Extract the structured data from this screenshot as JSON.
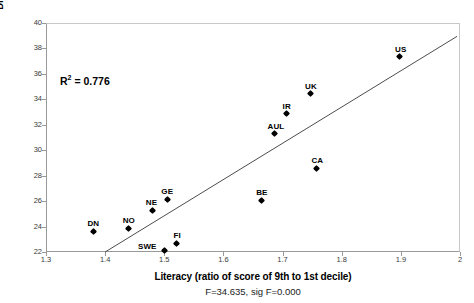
{
  "chart_data": {
    "type": "scatter",
    "title": "",
    "xlabel": "Literacy (ratio of score of 9th to 1st decile)",
    "ylabel": "Disposable income inequality (Gini)",
    "xlim": [
      1.3,
      2.0
    ],
    "ylim": [
      22,
      40
    ],
    "xticks": [
      "1.3",
      "1.4",
      "1.5",
      "1.6",
      "1.7",
      "1.8",
      "1.9",
      "2"
    ],
    "xtick_values": [
      1.3,
      1.4,
      1.5,
      1.6,
      1.7,
      1.8,
      1.9,
      2.0
    ],
    "yticks": [
      "22",
      "24",
      "26",
      "28",
      "30",
      "32",
      "34",
      "36",
      "38",
      "40"
    ],
    "ytick_values": [
      22,
      24,
      26,
      28,
      30,
      32,
      34,
      36,
      38,
      40
    ],
    "grid": false,
    "legend": false,
    "points": [
      {
        "label": "DN",
        "x": 1.38,
        "y": 23.65,
        "label_dx": 0,
        "label_dy": -11
      },
      {
        "label": "NO",
        "x": 1.44,
        "y": 23.85,
        "label_dx": 0,
        "label_dy": -11
      },
      {
        "label": "NE",
        "x": 1.48,
        "y": 25.3,
        "label_dx": -1,
        "label_dy": -11
      },
      {
        "label": "GE",
        "x": 1.505,
        "y": 26.15,
        "label_dx": 0,
        "label_dy": -11
      },
      {
        "label": "SWE",
        "x": 1.5,
        "y": 22.1,
        "label_dx": -17,
        "label_dy": -8
      },
      {
        "label": "FI",
        "x": 1.52,
        "y": 22.7,
        "label_dx": 1,
        "label_dy": -11
      },
      {
        "label": "BE",
        "x": 1.665,
        "y": 26.05,
        "label_dx": 0,
        "label_dy": -11
      },
      {
        "label": "AUL",
        "x": 1.687,
        "y": 31.3,
        "label_dx": 1,
        "label_dy": -11
      },
      {
        "label": "IR",
        "x": 1.707,
        "y": 32.85,
        "label_dx": 0,
        "label_dy": -11
      },
      {
        "label": "UK",
        "x": 1.748,
        "y": 34.45,
        "label_dx": 0,
        "label_dy": -11
      },
      {
        "label": "CA",
        "x": 1.757,
        "y": 28.6,
        "label_dx": 1,
        "label_dy": -11
      },
      {
        "label": "US",
        "x": 1.898,
        "y": 37.35,
        "label_dx": 1,
        "label_dy": -11
      }
    ],
    "trendline": {
      "x1": 1.4,
      "y1": 22.0,
      "x2": 1.995,
      "y2": 38.95
    },
    "annotations": [
      {
        "name": "r-squared",
        "text_prefix": "R",
        "text_sup": "2",
        "text_suffix": " = 0.776",
        "value": 0.776
      }
    ],
    "footnote": "F=34.635, sig F=0.000",
    "f_statistic": 34.635,
    "sig_f": 0.0,
    "marker_color": "#000000",
    "trendline_color": "#4d4d4d",
    "axis_color": "#9a9a9a"
  }
}
